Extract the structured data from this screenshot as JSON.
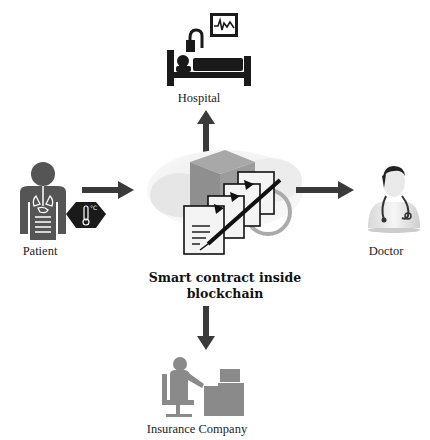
{
  "diagram": {
    "center": {
      "label_line1": "Smart contract inside",
      "label_line2": "blockchain"
    },
    "nodes": {
      "hospital": {
        "label": "Hospital"
      },
      "patient": {
        "label": "Patient"
      },
      "doctor": {
        "label": "Doctor"
      },
      "insurance": {
        "label": "Insurance Company"
      }
    },
    "edges": [
      {
        "from": "patient",
        "to": "center"
      },
      {
        "from": "center",
        "to": "hospital"
      },
      {
        "from": "center",
        "to": "doctor"
      },
      {
        "from": "center",
        "to": "insurance"
      }
    ],
    "colors": {
      "arrow": "#3a3a3a",
      "icon_dark": "#1a1a1a",
      "icon_gray": "#555555",
      "insurance_gray": "#8a8a8a",
      "cloud": "#d8d8d8"
    }
  }
}
